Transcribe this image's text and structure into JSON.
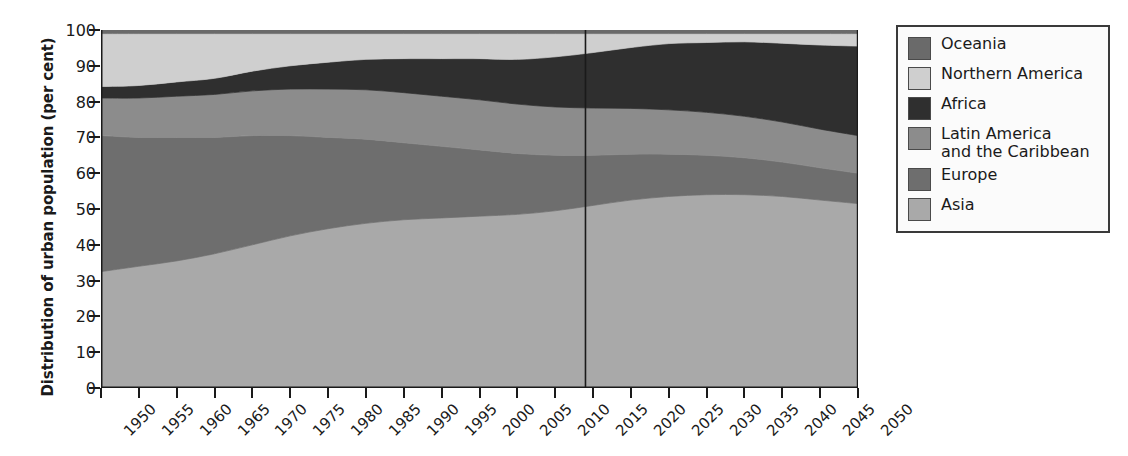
{
  "chart_data": {
    "type": "area",
    "title": "",
    "subtitle": "",
    "xlabel": "",
    "ylabel": "Distribution of urban population (per cent)",
    "xlim": [
      1950,
      2050
    ],
    "ylim": [
      0,
      100
    ],
    "grid": false,
    "stacked": true,
    "stack_order_bottom_to_top": [
      "Asia",
      "Europe",
      "Latin America and the Caribbean",
      "Africa",
      "Northern America",
      "Oceania"
    ],
    "legend_position": "right",
    "x": [
      1950,
      1955,
      1960,
      1965,
      1970,
      1975,
      1980,
      1985,
      1990,
      1995,
      2000,
      2005,
      2010,
      2015,
      2020,
      2025,
      2030,
      2035,
      2040,
      2045,
      2050
    ],
    "x_tick_labels": [
      "1950",
      "1955",
      "1960",
      "1965",
      "1970",
      "1975",
      "1980",
      "1985",
      "1990",
      "1995",
      "2000",
      "2005",
      "2010",
      "2015",
      "2020",
      "2025",
      "2030",
      "2035",
      "2040",
      "2045",
      "2050"
    ],
    "y_tick_labels": [
      "0",
      "10",
      "20",
      "30",
      "40",
      "50",
      "60",
      "70",
      "80",
      "90",
      "100"
    ],
    "y_ticks": [
      0,
      10,
      20,
      30,
      40,
      50,
      60,
      70,
      80,
      90,
      100
    ],
    "projection_divider_year": 2014,
    "series": [
      {
        "name": "Asia",
        "color": "#a9a9a9",
        "values": [
          32.5,
          34.0,
          35.5,
          37.5,
          40.0,
          42.5,
          44.5,
          46.0,
          47.0,
          47.5,
          48.0,
          48.5,
          49.5,
          51.0,
          52.5,
          53.5,
          54.0,
          54.0,
          53.5,
          52.5,
          51.5
        ]
      },
      {
        "name": "Europe",
        "color": "#6e6e6e",
        "values": [
          38.0,
          36.0,
          34.5,
          32.5,
          30.5,
          28.0,
          25.5,
          23.5,
          21.5,
          20.0,
          18.5,
          17.0,
          15.5,
          14.0,
          12.8,
          11.8,
          11.0,
          10.3,
          9.6,
          9.0,
          8.5
        ]
      },
      {
        "name": "Latin America and the Caribbean",
        "color": "#8c8c8c",
        "values": [
          10.5,
          11.0,
          11.5,
          12.0,
          12.5,
          13.0,
          13.5,
          13.8,
          14.0,
          14.0,
          14.0,
          13.8,
          13.5,
          13.2,
          12.8,
          12.4,
          12.0,
          11.6,
          11.2,
          10.8,
          10.5
        ]
      },
      {
        "name": "Africa",
        "color": "#2f2f2f",
        "values": [
          3.2,
          3.5,
          4.0,
          4.5,
          5.5,
          6.5,
          7.5,
          8.5,
          9.5,
          10.5,
          11.5,
          12.5,
          14.0,
          15.5,
          17.0,
          18.5,
          19.5,
          20.8,
          22.0,
          23.5,
          25.0
        ]
      },
      {
        "name": "Northern America",
        "color": "#cfcfcf",
        "values": [
          14.8,
          14.5,
          13.5,
          12.5,
          10.5,
          9.0,
          8.0,
          7.2,
          7.0,
          7.0,
          7.0,
          7.2,
          6.5,
          5.3,
          3.9,
          2.8,
          2.5,
          2.3,
          2.7,
          3.2,
          3.5
        ]
      },
      {
        "name": "Oceania",
        "color": "#6a6a6a",
        "values": [
          1.0,
          1.0,
          1.0,
          1.0,
          1.0,
          1.0,
          1.0,
          1.0,
          1.0,
          1.0,
          1.0,
          1.0,
          1.0,
          1.0,
          1.0,
          1.0,
          1.0,
          1.0,
          1.0,
          1.0,
          1.0
        ]
      }
    ],
    "legend": [
      {
        "label": "Oceania",
        "color": "#6a6a6a"
      },
      {
        "label": "Northern America",
        "color": "#cfcfcf"
      },
      {
        "label": "Africa",
        "color": "#2f2f2f"
      },
      {
        "label": "Latin America\nand the Caribbean",
        "color": "#8c8c8c"
      },
      {
        "label": "Europe",
        "color": "#6e6e6e"
      },
      {
        "label": "Asia",
        "color": "#a9a9a9"
      }
    ]
  },
  "axis": {
    "y_title": "Distribution of urban population (per cent)"
  }
}
